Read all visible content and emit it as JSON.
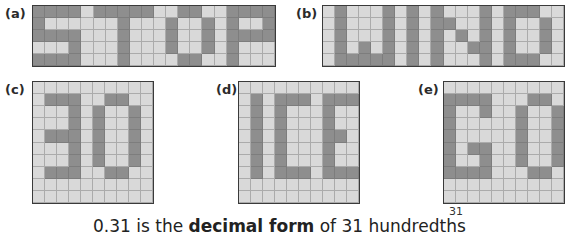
{
  "colors": {
    "on": "#8e8e8e",
    "off": "#d9d9d9",
    "gridline": "#ababab",
    "border": "#3a3a3a"
  },
  "panels": [
    {
      "label": "(a)",
      "word": "STOP",
      "cols": 20,
      "rows": 5,
      "left": 32,
      "top": 5,
      "width": 244,
      "height": 62,
      "labelLeft": 5,
      "labelTop": 6,
      "on": [
        [
          0,
          0
        ],
        [
          0,
          1
        ],
        [
          0,
          2
        ],
        [
          0,
          3
        ],
        [
          1,
          0
        ],
        [
          2,
          0
        ],
        [
          2,
          1
        ],
        [
          2,
          2
        ],
        [
          2,
          3
        ],
        [
          3,
          3
        ],
        [
          4,
          0
        ],
        [
          4,
          1
        ],
        [
          4,
          2
        ],
        [
          4,
          3
        ],
        [
          0,
          5
        ],
        [
          0,
          6
        ],
        [
          0,
          7
        ],
        [
          0,
          8
        ],
        [
          0,
          9
        ],
        [
          1,
          7
        ],
        [
          2,
          7
        ],
        [
          3,
          7
        ],
        [
          4,
          7
        ],
        [
          0,
          12
        ],
        [
          0,
          13
        ],
        [
          1,
          11
        ],
        [
          2,
          11
        ],
        [
          3,
          11
        ],
        [
          1,
          14
        ],
        [
          2,
          14
        ],
        [
          3,
          14
        ],
        [
          4,
          12
        ],
        [
          4,
          13
        ],
        [
          0,
          16
        ],
        [
          0,
          17
        ],
        [
          0,
          18
        ],
        [
          0,
          19
        ],
        [
          1,
          16
        ],
        [
          1,
          19
        ],
        [
          2,
          16
        ],
        [
          2,
          17
        ],
        [
          2,
          18
        ],
        [
          2,
          19
        ],
        [
          3,
          16
        ],
        [
          4,
          16
        ]
      ]
    },
    {
      "label": "(b)",
      "word": "WIND",
      "cols": 20,
      "rows": 5,
      "left": 322,
      "top": 5,
      "width": 243,
      "height": 62,
      "labelLeft": 296,
      "labelTop": 6,
      "on": [
        [
          0,
          1
        ],
        [
          1,
          1
        ],
        [
          2,
          1
        ],
        [
          3,
          1
        ],
        [
          4,
          1
        ],
        [
          0,
          5
        ],
        [
          1,
          5
        ],
        [
          2,
          5
        ],
        [
          3,
          5
        ],
        [
          4,
          5
        ],
        [
          3,
          3
        ],
        [
          4,
          2
        ],
        [
          4,
          3
        ],
        [
          4,
          4
        ],
        [
          0,
          7
        ],
        [
          1,
          7
        ],
        [
          2,
          7
        ],
        [
          3,
          7
        ],
        [
          4,
          7
        ],
        [
          0,
          9
        ],
        [
          1,
          9
        ],
        [
          2,
          9
        ],
        [
          3,
          9
        ],
        [
          4,
          9
        ],
        [
          1,
          10
        ],
        [
          2,
          11
        ],
        [
          3,
          12
        ],
        [
          0,
          13
        ],
        [
          1,
          13
        ],
        [
          2,
          13
        ],
        [
          3,
          13
        ],
        [
          4,
          13
        ],
        [
          0,
          15
        ],
        [
          0,
          16
        ],
        [
          0,
          17
        ],
        [
          1,
          15
        ],
        [
          2,
          15
        ],
        [
          3,
          15
        ],
        [
          4,
          15
        ],
        [
          1,
          18
        ],
        [
          2,
          18
        ],
        [
          3,
          18
        ],
        [
          4,
          16
        ],
        [
          4,
          17
        ]
      ]
    },
    {
      "label": "(c)",
      "word": "30",
      "cols": 10,
      "rows": 10,
      "left": 32,
      "top": 81,
      "width": 122,
      "height": 123,
      "labelLeft": 5,
      "labelTop": 82,
      "on": [
        [
          1,
          1
        ],
        [
          1,
          2
        ],
        [
          1,
          3
        ],
        [
          2,
          3
        ],
        [
          3,
          3
        ],
        [
          4,
          1
        ],
        [
          4,
          2
        ],
        [
          4,
          3
        ],
        [
          5,
          3
        ],
        [
          6,
          3
        ],
        [
          7,
          1
        ],
        [
          7,
          2
        ],
        [
          7,
          3
        ],
        [
          1,
          6
        ],
        [
          1,
          7
        ],
        [
          2,
          5
        ],
        [
          3,
          5
        ],
        [
          4,
          5
        ],
        [
          5,
          5
        ],
        [
          6,
          5
        ],
        [
          2,
          8
        ],
        [
          3,
          8
        ],
        [
          4,
          8
        ],
        [
          5,
          8
        ],
        [
          6,
          8
        ],
        [
          7,
          6
        ],
        [
          7,
          7
        ]
      ]
    },
    {
      "label": "(d)",
      "word": "ICE",
      "cols": 10,
      "rows": 10,
      "left": 238,
      "top": 81,
      "width": 122,
      "height": 123,
      "labelLeft": 216,
      "labelTop": 82,
      "on": [
        [
          1,
          1
        ],
        [
          2,
          1
        ],
        [
          3,
          1
        ],
        [
          4,
          1
        ],
        [
          5,
          1
        ],
        [
          6,
          1
        ],
        [
          7,
          1
        ],
        [
          1,
          3
        ],
        [
          1,
          4
        ],
        [
          1,
          5
        ],
        [
          2,
          3
        ],
        [
          3,
          3
        ],
        [
          4,
          3
        ],
        [
          5,
          3
        ],
        [
          6,
          3
        ],
        [
          7,
          3
        ],
        [
          7,
          4
        ],
        [
          7,
          5
        ],
        [
          1,
          7
        ],
        [
          1,
          8
        ],
        [
          1,
          9
        ],
        [
          2,
          7
        ],
        [
          3,
          7
        ],
        [
          4,
          7
        ],
        [
          4,
          8
        ],
        [
          5,
          7
        ],
        [
          6,
          7
        ],
        [
          7,
          7
        ],
        [
          7,
          8
        ],
        [
          7,
          9
        ]
      ]
    },
    {
      "label": "(e)",
      "word": "GO",
      "cols": 10,
      "rows": 10,
      "left": 443,
      "top": 81,
      "width": 122,
      "height": 123,
      "labelLeft": 418,
      "labelTop": 82,
      "on": [
        [
          1,
          0
        ],
        [
          1,
          1
        ],
        [
          1,
          2
        ],
        [
          1,
          3
        ],
        [
          2,
          0
        ],
        [
          2,
          3
        ],
        [
          3,
          0
        ],
        [
          4,
          0
        ],
        [
          5,
          0
        ],
        [
          5,
          2
        ],
        [
          5,
          3
        ],
        [
          6,
          0
        ],
        [
          6,
          3
        ],
        [
          7,
          0
        ],
        [
          7,
          1
        ],
        [
          7,
          2
        ],
        [
          7,
          3
        ],
        [
          1,
          7
        ],
        [
          1,
          8
        ],
        [
          2,
          6
        ],
        [
          3,
          6
        ],
        [
          4,
          6
        ],
        [
          5,
          6
        ],
        [
          6,
          6
        ],
        [
          2,
          9
        ],
        [
          3,
          9
        ],
        [
          4,
          9
        ],
        [
          5,
          9
        ],
        [
          6,
          9
        ],
        [
          7,
          7
        ],
        [
          7,
          8
        ]
      ]
    }
  ],
  "caption": {
    "prefix": "0.31 is the ",
    "bold": "decimal form",
    "suffix": " of 31 hundredths",
    "superscript": "31"
  }
}
